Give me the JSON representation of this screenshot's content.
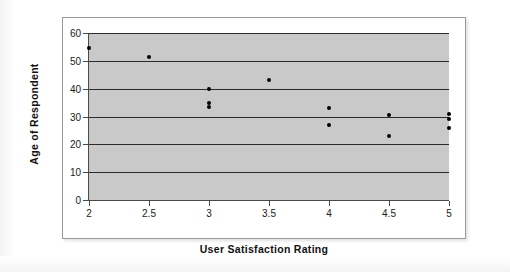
{
  "chart_data": {
    "type": "scatter",
    "title": "",
    "xlabel": "User Satisfaction Rating",
    "ylabel": "Age of Respondent",
    "xlim": [
      2,
      5
    ],
    "ylim": [
      0,
      60
    ],
    "xticks": [
      "2",
      "2.5",
      "3",
      "3.5",
      "4",
      "4.5",
      "5"
    ],
    "xtick_values": [
      2,
      2.5,
      3,
      3.5,
      4,
      4.5,
      5
    ],
    "yticks": [
      "0",
      "10",
      "20",
      "30",
      "40",
      "50",
      "60"
    ],
    "ytick_values": [
      0,
      10,
      20,
      30,
      40,
      50,
      60
    ],
    "grid": "horizontal",
    "legend": "none",
    "plot_background": "#c9c9c9",
    "marker_color": "#000000",
    "gridline_color": "#2b2b2b",
    "points": [
      {
        "x": 2,
        "y": 54.5
      },
      {
        "x": 2.5,
        "y": 51.5
      },
      {
        "x": 3,
        "y": 40
      },
      {
        "x": 3,
        "y": 35
      },
      {
        "x": 3,
        "y": 33.5
      },
      {
        "x": 3.5,
        "y": 43
      },
      {
        "x": 4,
        "y": 33
      },
      {
        "x": 4,
        "y": 27
      },
      {
        "x": 4.5,
        "y": 30.5
      },
      {
        "x": 4.5,
        "y": 23
      },
      {
        "x": 5,
        "y": 31
      },
      {
        "x": 5,
        "y": 29
      },
      {
        "x": 5,
        "y": 26
      }
    ]
  }
}
